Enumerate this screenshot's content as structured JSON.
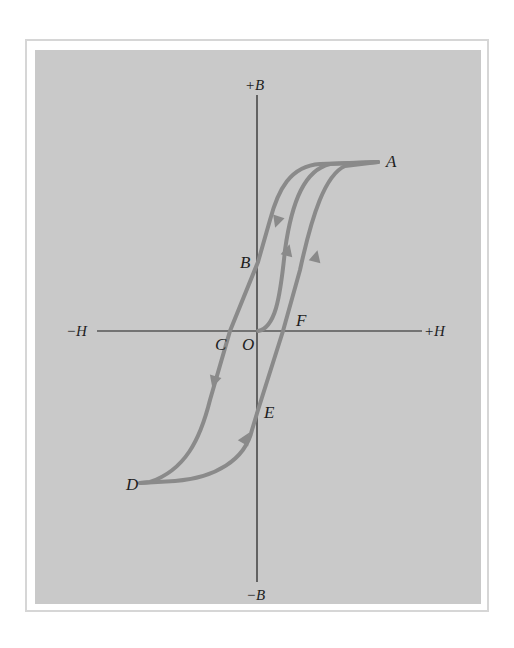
{
  "figure": {
    "axes": {
      "y_positive": "+B",
      "y_negative": "−B",
      "x_positive": "+H",
      "x_negative": "−H"
    },
    "points": {
      "A": "A",
      "B": "B",
      "C": "C",
      "D": "D",
      "E": "E",
      "F": "F",
      "O": "O"
    },
    "colors": {
      "panel": "#c9c9c9",
      "curve": "#8a8a8a",
      "axis": "#1e1e1e",
      "border": "#d6d6d6"
    }
  }
}
